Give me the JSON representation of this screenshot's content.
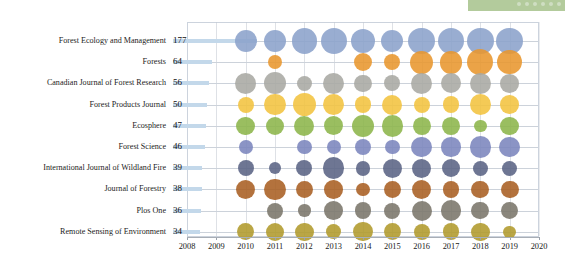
{
  "banner": {
    "name": "header-banner",
    "color": "#b3cb9c",
    "x": 468,
    "y": 0,
    "width": 97,
    "height": 11,
    "dot_count": 6
  },
  "plot": {
    "left": 187,
    "top": 22,
    "width": 352,
    "height": 215,
    "border_color": "#ccd3dd"
  },
  "axis": {
    "x_ticks": [
      "2008",
      "2009",
      "2010",
      "2011",
      "2012",
      "2013",
      "2014",
      "2015",
      "2016",
      "2017",
      "2018",
      "2019",
      "2020"
    ],
    "x_min": 2008,
    "x_max": 2020
  },
  "chart_data": {
    "type": "scatter",
    "title": "",
    "xlabel": "",
    "ylabel": "",
    "x": [
      2010,
      2011,
      2012,
      2013,
      2014,
      2015,
      2016,
      2017,
      2018,
      2019
    ],
    "categories": [
      "Forest Ecology and Management",
      "Forests",
      "Canadian Journal of Forest Research",
      "Forest Products Journal",
      "Ecosphere",
      "Forest Science",
      "International Journal of Wildland Fire",
      "Journal of Forestry",
      "Plos One",
      "Remote Sensing of Environment"
    ],
    "totals": [
      177,
      64,
      56,
      50,
      47,
      46,
      39,
      38,
      36,
      34
    ],
    "colors": [
      "#8ba2cb",
      "#e8962e",
      "#a8a8a3",
      "#f2c33f",
      "#8cb54a",
      "#7b85bd",
      "#5a6384",
      "#a85f22",
      "#7a756a",
      "#b09a2b"
    ],
    "series": [
      {
        "name": "Forest Ecology and Management",
        "values": [
          14,
          14,
          19,
          21,
          18,
          14,
          22,
          21,
          22,
          22
        ]
      },
      {
        "name": "Forests",
        "values": [
          0,
          4,
          0,
          0,
          9,
          6,
          16,
          15,
          21,
          18
        ]
      },
      {
        "name": "Canadian Journal of Forest Research",
        "values": [
          13,
          14,
          5,
          12,
          8,
          6,
          13,
          11,
          13,
          9
        ]
      },
      {
        "name": "Forest Products Journal",
        "values": [
          6,
          13,
          16,
          12,
          7,
          11,
          6,
          7,
          13,
          9
        ]
      },
      {
        "name": "Ecosphere",
        "values": [
          9,
          9,
          11,
          10,
          14,
          13,
          8,
          8,
          3,
          9
        ]
      },
      {
        "name": "Forest Science",
        "values": [
          4,
          0,
          5,
          4,
          7,
          5,
          12,
          10,
          13,
          12
        ]
      },
      {
        "name": "International Journal of Wildland Fire",
        "values": [
          6,
          3,
          6,
          13,
          5,
          10,
          10,
          9,
          5,
          5
        ]
      },
      {
        "name": "Journal of Forestry",
        "values": [
          10,
          13,
          7,
          9,
          4,
          7,
          10,
          7,
          8,
          8
        ]
      },
      {
        "name": "Plos One",
        "values": [
          0,
          6,
          3,
          9,
          7,
          6,
          11,
          12,
          8,
          7
        ]
      },
      {
        "name": "Remote Sensing of Environment",
        "values": [
          7,
          9,
          9,
          5,
          10,
          7,
          6,
          7,
          9,
          3
        ]
      }
    ],
    "legend": "none",
    "grid": true
  }
}
